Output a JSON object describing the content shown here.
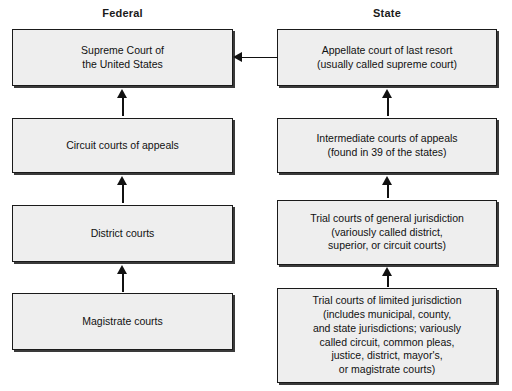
{
  "diagram": {
    "columns": [
      {
        "id": "federal",
        "header": "Federal"
      },
      {
        "id": "state",
        "header": "State"
      }
    ],
    "federal": {
      "boxes": [
        {
          "label": "Supreme Court of\nthe United States"
        },
        {
          "label": "Circuit courts of appeals"
        },
        {
          "label": "District courts"
        },
        {
          "label": "Magistrate courts"
        }
      ]
    },
    "state": {
      "boxes": [
        {
          "label": "Appellate court of last resort\n(usually called supreme court)"
        },
        {
          "label": "Intermediate courts of appeals\n(found in 39 of the states)"
        },
        {
          "label": "Trial courts of general jurisdiction\n(variously called district,\nsuperior, or circuit courts)"
        },
        {
          "label": "Trial courts of limited jurisdiction\n(includes municipal, county,\nand state jurisdictions; variously\ncalled circuit, common pleas,\njustice, district, mayor's,\nor magistrate courts)"
        }
      ]
    },
    "arrows": {
      "federal_up": [
        {
          "from": "Circuit courts of appeals",
          "to": "Supreme Court of the United States"
        },
        {
          "from": "District courts",
          "to": "Circuit courts of appeals"
        },
        {
          "from": "Magistrate courts",
          "to": "District courts"
        }
      ],
      "state_up": [
        {
          "from": "Intermediate courts of appeals",
          "to": "Appellate court of last resort"
        },
        {
          "from": "Trial courts of general jurisdiction",
          "to": "Intermediate courts of appeals"
        },
        {
          "from": "Trial courts of limited jurisdiction",
          "to": "Trial courts of general jurisdiction"
        }
      ],
      "cross": {
        "from": "Appellate court of last resort",
        "to": "Supreme Court of the United States",
        "direction": "left"
      }
    },
    "colors": {
      "box_fill": "#eeeeee",
      "box_border": "#1a1a1a",
      "box_shadow": "#3a3a3a",
      "text": "#111111",
      "background": "#ffffff"
    }
  }
}
